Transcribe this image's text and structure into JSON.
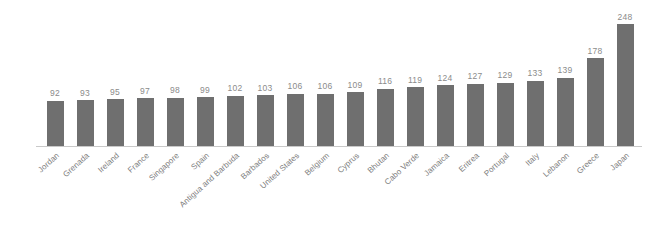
{
  "chart_data": {
    "type": "bar",
    "title": "",
    "subtitle": "",
    "xlabel": "",
    "ylabel": "",
    "ylim": [
      0,
      248
    ],
    "grid": false,
    "legend": false,
    "orientation": "vertical",
    "bar_color": "#6f6f6f",
    "value_label_color": "#8b8b8b",
    "category_label_color": "#7d7d7d",
    "axis_line_color": "#c9c9c9",
    "background_color": "#ffffff",
    "categories": [
      "Jordan",
      "Grenada",
      "Ireland",
      "France",
      "Singapore",
      "Spain",
      "Antigua and Barbuda",
      "Barbados",
      "United States",
      "Belgium",
      "Cyprus",
      "Bhutan",
      "Cabo Verde",
      "Jamaica",
      "Eritrea",
      "Portugal",
      "Italy",
      "Lebanon",
      "Greece",
      "Japan"
    ],
    "values": [
      92,
      93,
      95,
      97,
      98,
      99,
      102,
      103,
      106,
      106,
      109,
      116,
      119,
      124,
      127,
      129,
      133,
      139,
      178,
      248
    ],
    "value_labels": [
      "92",
      "93",
      "95",
      "97",
      "98",
      "99",
      "102",
      "103",
      "106",
      "106",
      "109",
      "116",
      "119",
      "124",
      "127",
      "129",
      "133",
      "139",
      "178",
      "248"
    ]
  }
}
